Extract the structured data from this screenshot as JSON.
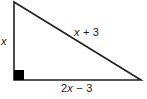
{
  "figure": {
    "kind": "right-triangle-diagram",
    "background_color": "#ffffff",
    "stroke_color": "#231f20",
    "text_color": "#1a1a1a",
    "right_angle_marker": {
      "name": "right-angle-square",
      "filled": true,
      "color": "#000000",
      "x": 14,
      "y": 70,
      "size": 10
    },
    "vertices": {
      "top": [
        14,
        2
      ],
      "bottom_left": [
        14,
        80
      ],
      "bottom_right": [
        141,
        80
      ]
    },
    "labels": {
      "vertical_leg": "x",
      "hypotenuse_var": "x",
      "hypotenuse_rest": " + 3",
      "hypotenuse_full": "x + 3",
      "horizontal_leg_prefix": "2",
      "horizontal_leg_var": "x",
      "horizontal_leg_rest": " − 3",
      "horizontal_leg_full": "2x − 3"
    }
  }
}
